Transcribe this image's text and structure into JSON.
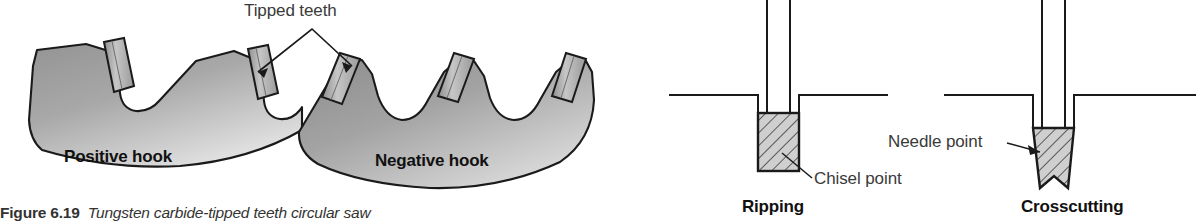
{
  "figure": {
    "caption_number": "Figure 6.19",
    "caption_text": "Tungsten carbide-tipped teeth circular saw",
    "labels": {
      "tipped_teeth": "Tipped teeth",
      "positive_hook": "Positive hook",
      "negative_hook": "Negative hook",
      "chisel_point": "Chisel point",
      "needle_point": "Needle point",
      "ripping": "Ripping",
      "crosscutting": "Crosscutting"
    },
    "colors": {
      "outline": "#1a1a1a",
      "blade_gray_dark": "#8d8d8d",
      "blade_gray_light": "#d8d8d8",
      "tooth_gray": "#b9b9b9",
      "hatch_fill": "#cfcfcf",
      "page_background": "#ffffff",
      "label_text": "#111111",
      "leader_text": "#3a3a3a"
    }
  }
}
